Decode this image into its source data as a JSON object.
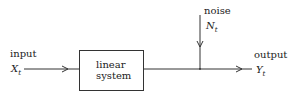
{
  "diagram": {
    "input": {
      "label": "input",
      "symbol": "X",
      "subscript": "t"
    },
    "system": {
      "line1": "linear",
      "line2": "system"
    },
    "noise": {
      "label": "noise",
      "symbol": "N",
      "subscript": "t"
    },
    "output": {
      "label": "output",
      "symbol": "Y",
      "subscript": "t"
    },
    "stroke_color": "#333333"
  }
}
